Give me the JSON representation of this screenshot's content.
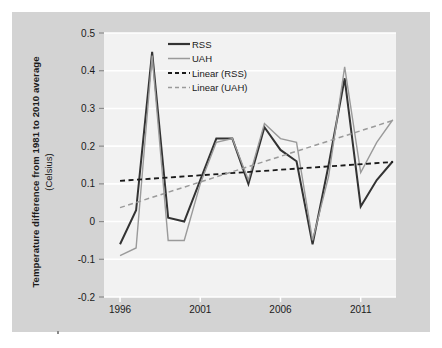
{
  "panel": {
    "background_color": "#d3d3d3",
    "plot_background_color": "#f2f2f2"
  },
  "axis": {
    "ylabel_line1": "Temperature difference from 1981 to 2010 average",
    "ylabel_line2": "(Celsius)"
  },
  "chart_data": {
    "type": "line",
    "title": "",
    "subtitle": "",
    "xlabel": "",
    "ylabel": "Temperature difference from 1981 to 2010 average (Celsius)",
    "xlim": [
      1995.0,
      2013.2
    ],
    "ylim": [
      -0.2,
      0.5
    ],
    "yticks": [
      0.5,
      0.4,
      0.3,
      0.2,
      0.1,
      0,
      -0.1,
      -0.2
    ],
    "ytick_labels": [
      "0.5",
      "0.4",
      "0.3",
      "0.2",
      "0.1",
      "0",
      "-0.1",
      "-0.2"
    ],
    "xticks": [
      1996,
      2001,
      2006,
      2011
    ],
    "xtick_labels": [
      "1996",
      "2001",
      "2006",
      "2011"
    ],
    "grid": "horizontal-white",
    "legend_position": "top-right-inside",
    "x": [
      1996,
      1997,
      1998,
      1999,
      2000,
      2001,
      2002,
      2003,
      2004,
      2005,
      2006,
      2007,
      2008,
      2009,
      2010,
      2011,
      2012,
      2013
    ],
    "series": [
      {
        "name": "RSS",
        "style": "solid",
        "color": "#333333",
        "width": 2.0,
        "values": [
          -0.06,
          0.03,
          0.45,
          0.01,
          0.0,
          0.11,
          0.22,
          0.22,
          0.1,
          0.25,
          0.19,
          0.16,
          -0.06,
          0.15,
          0.38,
          0.04,
          0.11,
          0.16
        ]
      },
      {
        "name": "UAH",
        "style": "solid",
        "color": "#9a9a9a",
        "width": 1.4,
        "values": [
          -0.09,
          -0.07,
          0.44,
          -0.05,
          -0.05,
          0.1,
          0.21,
          0.22,
          0.11,
          0.26,
          0.22,
          0.21,
          -0.05,
          0.12,
          0.41,
          0.13,
          0.21,
          0.27
        ]
      },
      {
        "name": "Linear (RSS)",
        "style": "dashed",
        "color": "#1a1a1a",
        "width": 1.8,
        "trend": true,
        "endpoints": [
          [
            1996,
            0.108
          ],
          [
            2013,
            0.158
          ]
        ]
      },
      {
        "name": "Linear (UAH)",
        "style": "dashed",
        "color": "#9a9a9a",
        "width": 1.5,
        "trend": true,
        "endpoints": [
          [
            1996,
            0.037
          ],
          [
            2013,
            0.268
          ]
        ]
      }
    ],
    "legend": [
      {
        "label": "RSS",
        "style": "solid",
        "color": "#333333",
        "width": 2.2
      },
      {
        "label": "UAH",
        "style": "solid",
        "color": "#9a9a9a",
        "width": 1.5
      },
      {
        "label": "Linear (RSS)",
        "style": "dashed",
        "color": "#1a1a1a",
        "width": 1.8
      },
      {
        "label": "Linear (UAH)",
        "style": "dashed",
        "color": "#9a9a9a",
        "width": 1.5
      }
    ]
  }
}
